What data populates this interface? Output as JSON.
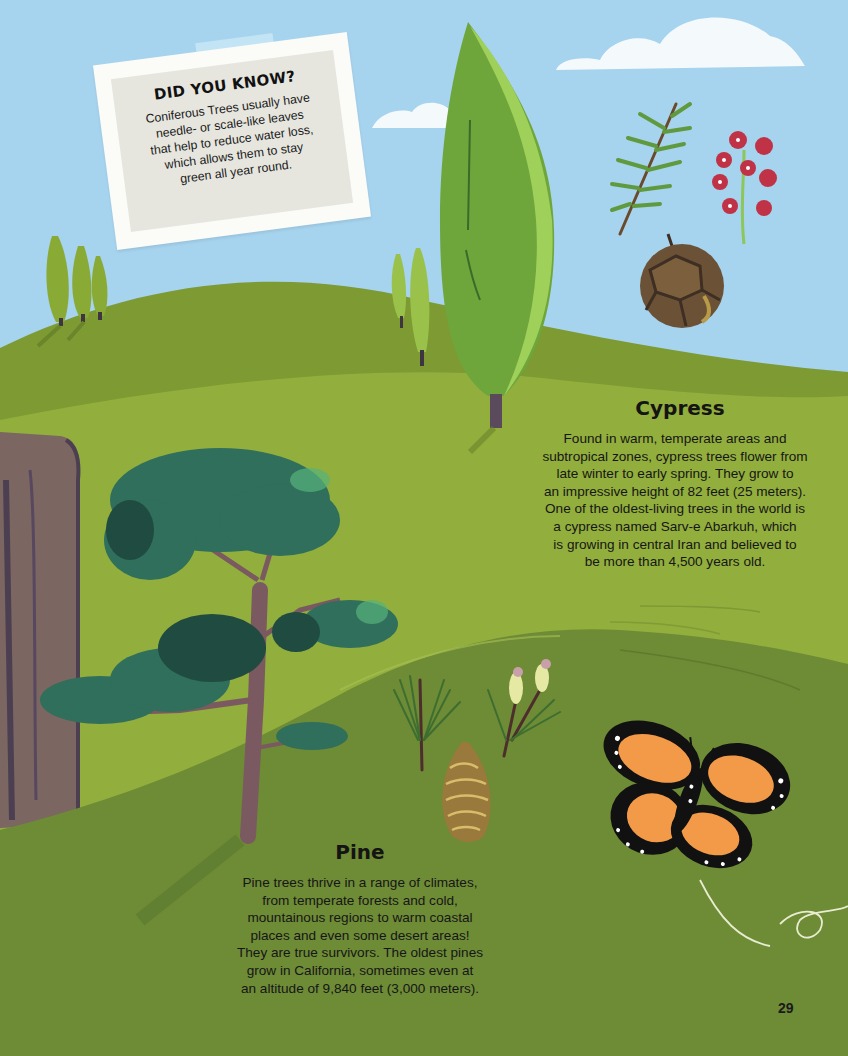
{
  "page": {
    "number": "29",
    "colors": {
      "sky": "#a6d3ee",
      "upper_hill": "#7f9a34",
      "middle_hill": "#95b23e",
      "lower_hill": "#6c8a36",
      "text": "#161616",
      "butterfly_orange": "#f29a48"
    }
  },
  "did_you_know": {
    "title": "DID YOU KNOW?",
    "lines": [
      "Coniferous Trees usually have",
      "needle- or scale-like leaves",
      "that help to reduce water loss,",
      "which allows them to stay",
      "green all year round."
    ]
  },
  "cypress": {
    "title": "Cypress",
    "lines": [
      "Found in warm, temperate areas and",
      "subtropical zones, cypress trees flower from",
      "late winter to early spring. They grow to",
      "an impressive height of 82 feet (25 meters).",
      "One of the oldest-living trees in the world is",
      "a cypress named Sarv-e Abarkuh, which",
      "is growing in central Iran and believed to",
      "be more than 4,500 years old."
    ]
  },
  "pine": {
    "title": "Pine",
    "lines": [
      "Pine trees thrive in a range of climates,",
      "from temperate forests and cold,",
      "mountainous regions to warm coastal",
      "places and even some desert areas!",
      "They are true survivors. The oldest pines",
      "grow in California, sometimes even at",
      "an altitude of 9,840 feet (3,000 meters)."
    ]
  },
  "illustrations": [
    "cloud",
    "cypress-tree",
    "small-cypress-trees",
    "cypress-sprig",
    "cypress-flower",
    "cypress-cone",
    "rock-cliff",
    "pine-tree",
    "pine-needles",
    "pine-flower",
    "pine-cone",
    "monarch-butterfly"
  ]
}
